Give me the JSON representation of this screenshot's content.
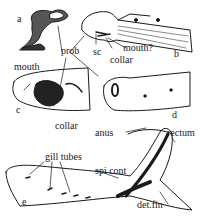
{
  "figure": {
    "panels": {
      "a": "a",
      "b": "b",
      "c": "c",
      "d": "d",
      "e": "e"
    },
    "labels": {
      "prob": "prob",
      "sc": "sc",
      "mouth_q": "mouth?",
      "collar_b": "collar",
      "mouth_c": "mouth",
      "collar_c": "collar",
      "anus": "anus",
      "rectum": "rectum",
      "gill_tubes": "gill tubes",
      "spi_cont": "spi cont",
      "det_fin": "det.fin"
    },
    "colors": {
      "ink": "#1a1a1a",
      "background": "#ffffff"
    }
  }
}
